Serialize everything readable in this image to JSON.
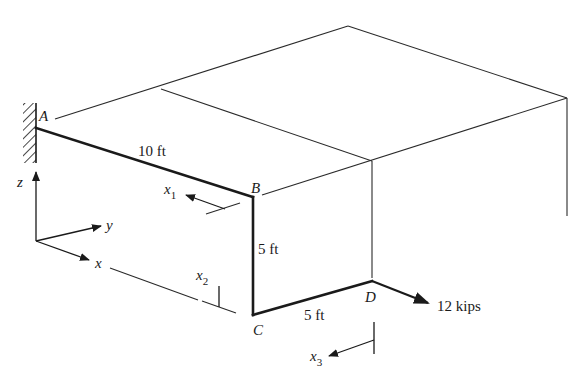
{
  "diagram": {
    "type": "3D frame structure (cantilevered bent member)",
    "points": {
      "A": "A",
      "B": "B",
      "C": "C",
      "D": "D"
    },
    "dimensions": {
      "AB": "10 ft",
      "BC": "5 ft",
      "CD": "5 ft"
    },
    "load": {
      "label": "12 kips",
      "at": "D"
    },
    "axes": {
      "x": "x",
      "y": "y",
      "z": "z"
    },
    "sections": {
      "x1": {
        "base": "x",
        "sub": "1"
      },
      "x2": {
        "base": "x",
        "sub": "2"
      },
      "x3": {
        "base": "x",
        "sub": "3"
      }
    }
  }
}
